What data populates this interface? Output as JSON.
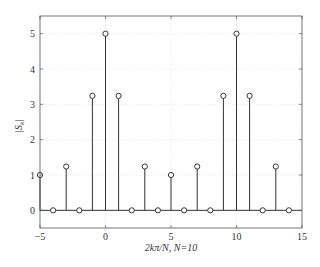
{
  "chart_data": {
    "type": "stem",
    "title": "",
    "xlabel": "2kπ/N, N=10",
    "ylabel": "|S_k|",
    "xlim": [
      -5,
      15
    ],
    "ylim": [
      -0.5,
      5.5
    ],
    "xticks": [
      -5,
      0,
      5,
      10,
      15
    ],
    "yticks": [
      0,
      1,
      2,
      3,
      4,
      5
    ],
    "grid": true,
    "legend": null,
    "x": [
      -5,
      -4,
      -3,
      -2,
      -1,
      0,
      1,
      2,
      3,
      4,
      5,
      6,
      7,
      8,
      9,
      10,
      11,
      12,
      13,
      14
    ],
    "values": [
      1,
      0,
      1.24,
      0,
      3.24,
      5,
      3.24,
      0,
      1.24,
      0,
      1,
      0,
      1.24,
      0,
      3.24,
      5,
      3.24,
      0,
      1.24,
      0
    ],
    "colors": {
      "stem": "#333333",
      "axis": "#444444",
      "grid": "#cccccc"
    }
  },
  "labels": {
    "xlabel_main": "2kπ/N,",
    "xlabel_n": " N=10",
    "ylabel": "|S",
    "ylabel_sub": "k",
    "ylabel_end": "|"
  }
}
